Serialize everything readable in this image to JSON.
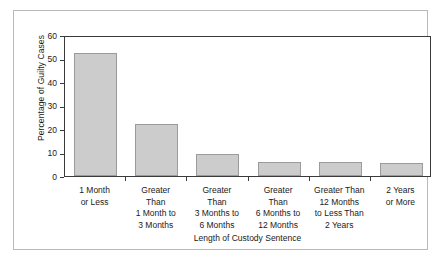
{
  "chart_data": {
    "type": "bar",
    "title": "",
    "xlabel": "Length of Custody Sentence",
    "ylabel": "Percentage of Guilty Cases",
    "ylim": [
      0,
      60
    ],
    "ytick_labels": [
      "0",
      "10",
      "20",
      "30",
      "40",
      "50",
      "60"
    ],
    "ytick_values": [
      0,
      10,
      20,
      30,
      40,
      50,
      60
    ],
    "grid": false,
    "legend": false,
    "bar_fill_color": "#cccccc",
    "bar_edge_color": "#9b9b9b",
    "axis_color": "#3a3a3a",
    "frame_color": "#b9b9b9",
    "categories": [
      "1 Month or Less",
      "Greater Than 1 Month to 3 Months",
      "Greater Than 3 Months to 6 Months",
      "Greater Than 6 Months to 12 Months",
      "Greater Than 12 Months to Less Than 2 Years",
      "2 Years or More"
    ],
    "category_lines": [
      [
        "1 Month",
        "or Less"
      ],
      [
        "Greater",
        "Than",
        "1 Month to",
        "3 Months"
      ],
      [
        "Greater",
        "Than",
        "3 Months to",
        "6 Months"
      ],
      [
        "Greater",
        "Than",
        "6 Months to",
        "12 Months"
      ],
      [
        "Greater Than",
        "12 Months",
        "to Less Than",
        "2 Years"
      ],
      [
        "2 Years",
        "or More"
      ]
    ],
    "values": [
      52.5,
      22,
      9.4,
      6,
      5.8,
      5.5
    ]
  }
}
